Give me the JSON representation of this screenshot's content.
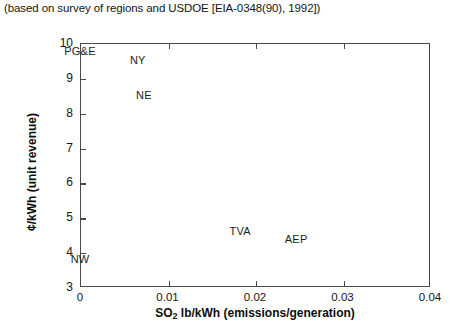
{
  "caption": "(based on survey of regions and USDOE [EIA-0348(90), 1992])",
  "chart_data": {
    "type": "scatter",
    "title": "",
    "subtitle": "(based on survey of regions and USDOE [EIA-0348(90), 1992])",
    "xlabel": "SO2 lb/kWh (emissions/generation)",
    "xlabel_base": "SO",
    "xlabel_sub": "2",
    "xlabel_rest": " lb/kWh (emissions/generation)",
    "ylabel": "¢/kWh (unit revenue)",
    "xlim": [
      0,
      0.04
    ],
    "ylim": [
      3,
      10
    ],
    "xticks": [
      0,
      0.01,
      0.02,
      0.03,
      0.04
    ],
    "xticklabels": [
      "0",
      "0.01",
      "0.02",
      "0.03",
      "0.04"
    ],
    "yticks": [
      3,
      4,
      5,
      6,
      7,
      8,
      9,
      10
    ],
    "yticklabels": [
      "3",
      "4",
      "5",
      "6",
      "7",
      "8",
      "9",
      "10"
    ],
    "grid": false,
    "legend": "none",
    "marker_style": "text-label-only",
    "points": [
      {
        "label": "PG&E",
        "x": 0.0,
        "y": 9.78
      },
      {
        "label": "NY",
        "x": 0.0066,
        "y": 9.5
      },
      {
        "label": "NE",
        "x": 0.0073,
        "y": 8.5
      },
      {
        "label": "TVA",
        "x": 0.0183,
        "y": 4.62
      },
      {
        "label": "AEP",
        "x": 0.0247,
        "y": 4.37
      },
      {
        "label": "NW",
        "x": 0.0,
        "y": 3.8
      }
    ]
  },
  "colors": {
    "axis": "#4a4a4a",
    "text": "#141414",
    "background": "#ffffff"
  }
}
